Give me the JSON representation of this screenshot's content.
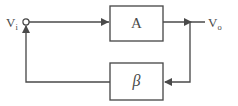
{
  "diagram": {
    "type": "block-diagram",
    "canvas": {
      "width": 238,
      "height": 106
    },
    "colors": {
      "stroke": "#4a4a4a",
      "background": "#ffffff",
      "label": "#4a4a4a"
    },
    "blocks": [
      {
        "id": "forward-amplifier",
        "label": "A",
        "name": "forward-gain-block",
        "x": 110,
        "y": 6,
        "width": 53,
        "height": 35
      },
      {
        "id": "feedback-network",
        "label": "β",
        "name": "feedback-gain-block",
        "x": 110,
        "y": 63,
        "width": 53,
        "height": 37
      }
    ],
    "ports": [
      {
        "id": "input",
        "base": "V",
        "subscript": "i",
        "full": "Vi",
        "name": "input-port-label",
        "x": 6,
        "y": 26
      },
      {
        "id": "output",
        "base": "V",
        "subscript": "o",
        "full": "Vo",
        "name": "output-port-label",
        "x": 208,
        "y": 26
      }
    ],
    "nodes": [
      {
        "id": "summing-node",
        "name": "summing-junction-node",
        "cx": 26,
        "cy": 22,
        "r": 3.1
      }
    ],
    "wires": [
      {
        "id": "input-to-A",
        "name": "wire-input-to-amplifier",
        "path": "M 29 22 L 109 22"
      },
      {
        "id": "A-to-output",
        "name": "wire-amplifier-to-output",
        "path": "M 163 22 L 205 22"
      },
      {
        "id": "output-tap-down",
        "name": "wire-output-tap-to-feedback",
        "path": "M 190 22 L 190 82 L 165 82"
      },
      {
        "id": "beta-to-node",
        "name": "wire-feedback-to-summing-node",
        "path": "M 110 82 L 26 82 L 26 26"
      }
    ],
    "arrows": [
      {
        "id": "arrow-into-A",
        "name": "arrowhead-into-amplifier",
        "x": 109,
        "y": 22,
        "dir": "right"
      },
      {
        "id": "arrow-output-tap",
        "name": "arrowhead-at-output-tap",
        "x": 190,
        "y": 22,
        "dir": "right"
      },
      {
        "id": "arrow-into-beta",
        "name": "arrowhead-into-feedback-block",
        "x": 164,
        "y": 82,
        "dir": "left"
      },
      {
        "id": "arrow-into-node",
        "name": "arrowhead-into-summing-node",
        "x": 26,
        "y": 26,
        "dir": "up"
      }
    ]
  }
}
